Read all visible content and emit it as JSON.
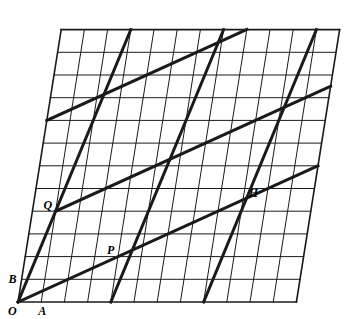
{
  "figure": {
    "background_color": "#ffffff",
    "stroke_color": "#1a1a1a",
    "grid_line_width": 1,
    "thick_line_width": 3,
    "border_line_width": 1.6,
    "width": 346,
    "height": 319
  },
  "lattice": {
    "origin": {
      "x": 18,
      "y": 302
    },
    "vector_a": {
      "x": 23.2,
      "y": 0
    },
    "vector_b": {
      "x": 3.6,
      "y": -22.7
    },
    "columns": 12,
    "rows": 12,
    "description": "Oblique lattice spanned by OA and OB"
  },
  "points": [
    {
      "name": "O",
      "label": "O",
      "u": 0,
      "v": 0,
      "label_dx": -10,
      "label_dy": 13
    },
    {
      "name": "A",
      "label": "A",
      "u": 1,
      "v": 0,
      "label_dx": -3,
      "label_dy": 13
    },
    {
      "name": "B",
      "label": "B",
      "u": 0,
      "v": 1,
      "label_dx": -13,
      "label_dy": 4
    },
    {
      "name": "P",
      "label": "P",
      "u": 4,
      "v": 2,
      "label_dx": -11,
      "label_dy": -3
    },
    {
      "name": "Q",
      "label": "Q",
      "u": 1,
      "v": 4,
      "label_dx": -12,
      "label_dy": -2
    },
    {
      "name": "H",
      "label": "H",
      "u": 9,
      "v": 5,
      "label_dx": 4,
      "label_dy": 8
    }
  ],
  "thick_lines": [
    {
      "name": "ray-OQ-steep-1",
      "from": {
        "u": 0,
        "v": 0
      },
      "to": {
        "u": 3,
        "v": 12
      }
    },
    {
      "name": "ray-OP-shallow-1",
      "from": {
        "u": 0,
        "v": 0
      },
      "to": {
        "u": 12,
        "v": 6
      }
    },
    {
      "name": "steep-parallel-2",
      "from": {
        "u": 4,
        "v": 0
      },
      "to": {
        "u": 7,
        "v": 12
      }
    },
    {
      "name": "steep-parallel-3",
      "from": {
        "u": 8,
        "v": 0
      },
      "to": {
        "u": 11,
        "v": 12
      }
    },
    {
      "name": "shallow-parallel-2",
      "from": {
        "u": 1,
        "v": 4
      },
      "to": {
        "u": 12,
        "v": 9.5
      }
    },
    {
      "name": "shallow-parallel-3",
      "from": {
        "u": 0,
        "v": 8
      },
      "to": {
        "u": 8,
        "v": 12
      }
    }
  ],
  "legend": {
    "note": "Thick segments are lattice rays from O and their parallels"
  }
}
